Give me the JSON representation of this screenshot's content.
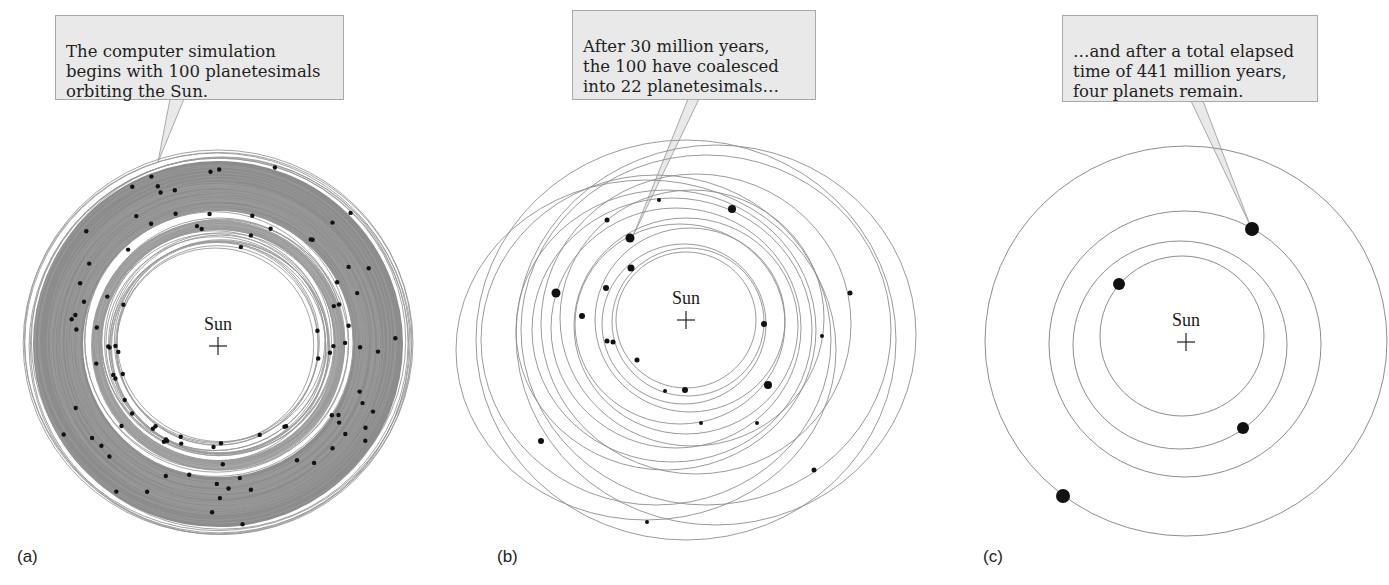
{
  "figure": {
    "panels": [
      {
        "id": "a",
        "label": "(a)",
        "callout": "The computer simulation\nbegins with 100 planetesimals\norbiting the Sun.",
        "sun_label": "Sun",
        "planetesimal_count": 100,
        "center": [
          218,
          346
        ]
      },
      {
        "id": "b",
        "label": "(b)",
        "callout": "After 30 million years,\nthe 100 have coalesced\ninto 22 planetesimals…",
        "sun_label": "Sun",
        "elapsed_million_years": 30,
        "planetesimal_count": 22,
        "center": [
          686,
          320
        ]
      },
      {
        "id": "c",
        "label": "(c)",
        "callout": "…and after a total elapsed\ntime of 441 million years,\nfour planets remain.",
        "sun_label": "Sun",
        "elapsed_million_years": 441,
        "planet_count": 4,
        "center": [
          1186,
          342
        ]
      }
    ],
    "colors": {
      "callout_fill": "#e9e9e9",
      "callout_border": "#a9a9a9",
      "orbit": "#9a9a9a",
      "dense_band": "#8c8c8c",
      "body": "#111111"
    },
    "icons": {
      "sun_marker": "plus-cross",
      "body": "filled-circle"
    }
  }
}
